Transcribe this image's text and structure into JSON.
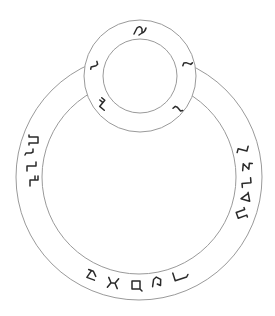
{
  "diagram": {
    "type": "concentric-ring-glyph-diagram",
    "background": "#ffffff",
    "line_color": "#9a9a9a",
    "glyph_color": "#2a2a2a",
    "large_ring": {
      "cx": 139,
      "cy": 177,
      "outer_r": 123,
      "inner_r": 97,
      "glyphs": [
        {
          "name": "glyph-left-1",
          "x": 34,
          "y": 140,
          "rot": 90,
          "shape": "pi-hook"
        },
        {
          "name": "glyph-left-2",
          "x": 30,
          "y": 153,
          "rot": 90,
          "shape": "s-tick"
        },
        {
          "name": "glyph-left-3",
          "x": 31,
          "y": 166,
          "rot": 90,
          "shape": "l-step"
        },
        {
          "name": "glyph-left-4",
          "x": 34,
          "y": 181,
          "rot": 90,
          "shape": "z-step"
        },
        {
          "name": "glyph-right-1",
          "x": 243,
          "y": 150,
          "rot": -75,
          "shape": "l-step"
        },
        {
          "name": "glyph-right-2",
          "x": 247,
          "y": 167,
          "rot": -85,
          "shape": "hook-5"
        },
        {
          "name": "glyph-right-3",
          "x": 247,
          "y": 183,
          "rot": -95,
          "shape": "l-step"
        },
        {
          "name": "glyph-right-4",
          "x": 245,
          "y": 198,
          "rot": -100,
          "shape": "triangle-foot"
        },
        {
          "name": "glyph-right-5",
          "x": 241,
          "y": 214,
          "rot": -110,
          "shape": "pi-hook"
        },
        {
          "name": "glyph-bottom-1",
          "x": 92,
          "y": 275,
          "rot": 20,
          "shape": "lambda-q"
        },
        {
          "name": "glyph-bottom-2",
          "x": 113,
          "y": 283,
          "rot": 8,
          "shape": "x-cross"
        },
        {
          "name": "glyph-bottom-3",
          "x": 136,
          "y": 285,
          "rot": 0,
          "shape": "box"
        },
        {
          "name": "glyph-bottom-4",
          "x": 157,
          "y": 282,
          "rot": -8,
          "shape": "a-hook"
        },
        {
          "name": "glyph-bottom-5",
          "x": 180,
          "y": 276,
          "rot": -18,
          "shape": "l-long"
        }
      ]
    },
    "small_ring": {
      "cx": 140,
      "cy": 76,
      "outer_r": 56,
      "inner_r": 37,
      "glyphs": [
        {
          "name": "glyph-small-top",
          "x": 140,
          "y": 30,
          "rot": 0,
          "shape": "curl-hook"
        },
        {
          "name": "glyph-small-left",
          "x": 95,
          "y": 66,
          "rot": 75,
          "shape": "s-tick"
        },
        {
          "name": "glyph-small-right",
          "x": 187,
          "y": 63,
          "rot": -70,
          "shape": "s-tick"
        },
        {
          "name": "glyph-small-lower-left",
          "x": 103,
          "y": 104,
          "rot": 40,
          "shape": "z-step"
        },
        {
          "name": "glyph-small-lower-right",
          "x": 178,
          "y": 108,
          "rot": -40,
          "shape": "s-tick"
        }
      ]
    }
  }
}
